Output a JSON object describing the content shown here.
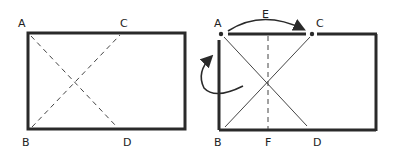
{
  "figures": [
    {
      "id": "left",
      "description": "Rectangle with dashed diagonals",
      "labels": {
        "A": "A",
        "B": "B",
        "C": "C",
        "D": "D"
      }
    },
    {
      "id": "right",
      "description": "Rectangle folded: A moved to C, with crease line E-F",
      "labels": {
        "A": "A",
        "B": "B",
        "C": "C",
        "D": "D",
        "E": "E",
        "F": "F"
      }
    }
  ],
  "colors": {
    "stroke": "#2a2a2a",
    "background": "#ffffff"
  }
}
